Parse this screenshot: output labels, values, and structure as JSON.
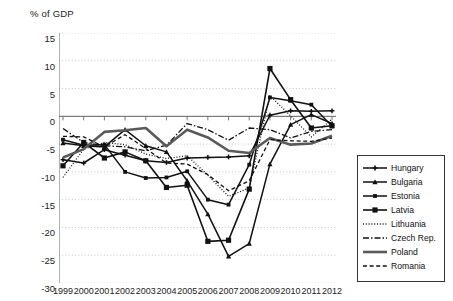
{
  "chart": {
    "axis_title": "% of GDP",
    "y_ticks": [
      "15",
      "10",
      "5",
      "0",
      "-5",
      "-10",
      "-15",
      "-20",
      "-25",
      "-30"
    ],
    "x_ticks": [
      "1999",
      "2000",
      "2001",
      "2002",
      "2003",
      "2004",
      "2005",
      "2006",
      "2007",
      "2008",
      "2009",
      "2010",
      "2011",
      "2012"
    ]
  },
  "legend": {
    "items": [
      {
        "label": "Hungary",
        "key": "line-marker-cross"
      },
      {
        "label": "Bulgaria",
        "key": "line-marker-triangle"
      },
      {
        "label": "Estonia",
        "key": "line-marker-diamond"
      },
      {
        "label": "Latvia",
        "key": "line-marker-square"
      },
      {
        "label": "Lithuania",
        "key": "line-dotted"
      },
      {
        "label": "Czech Rep.",
        "key": "line-dash-dot"
      },
      {
        "label": "Poland",
        "key": "line-thick-double"
      },
      {
        "label": "Romania",
        "key": "line-dashed"
      }
    ]
  },
  "chart_data": {
    "type": "line",
    "title": "",
    "xlabel": "",
    "ylabel": "% of GDP",
    "ylim": [
      -30,
      15
    ],
    "ytick_step": 5,
    "grid": true,
    "legend_position": "right-inside",
    "x": [
      1999,
      2000,
      2001,
      2002,
      2003,
      2004,
      2005,
      2006,
      2007,
      2008,
      2009,
      2010,
      2011,
      2012
    ],
    "series": [
      {
        "name": "Hungary",
        "values": [
          -7.8,
          -8.4,
          -6.0,
          -7.0,
          -8.0,
          -8.3,
          -7.5,
          -7.4,
          -7.3,
          -7.1,
          0.2,
          1.0,
          0.9,
          1.0
        ]
      },
      {
        "name": "Bulgaria",
        "values": [
          -4.8,
          -5.3,
          -5.5,
          -2.4,
          -5.3,
          -6.4,
          -11.6,
          -17.6,
          -25.2,
          -22.9,
          -8.6,
          -1.5,
          0.3,
          -1.3
        ]
      },
      {
        "name": "Estonia",
        "values": [
          -4.2,
          -5.2,
          -5.1,
          -10.0,
          -11.1,
          -11.0,
          -9.9,
          -15.0,
          -15.9,
          -8.7,
          3.4,
          2.8,
          2.1,
          -1.8
        ]
      },
      {
        "name": "Latvia",
        "values": [
          -8.9,
          -4.7,
          -7.5,
          -6.4,
          -8.0,
          -12.8,
          -12.4,
          -22.5,
          -22.3,
          -13.1,
          8.6,
          3.0,
          -2.1,
          -1.7
        ]
      },
      {
        "name": "Lithuania",
        "values": [
          -11.0,
          -5.9,
          -4.7,
          -5.1,
          -6.8,
          -7.6,
          -7.1,
          -10.6,
          -14.4,
          -12.9,
          3.7,
          0.1,
          -3.7,
          -0.5
        ]
      },
      {
        "name": "Czech Rep.",
        "values": [
          -2.2,
          -4.7,
          -5.3,
          -5.5,
          -6.2,
          -5.2,
          -1.3,
          -2.4,
          -4.3,
          -2.1,
          -2.4,
          -3.9,
          -2.7,
          -2.4
        ]
      },
      {
        "name": "Poland",
        "values": [
          -7.4,
          -5.9,
          -2.8,
          -2.5,
          -2.1,
          -5.4,
          -2.4,
          -3.8,
          -6.2,
          -6.6,
          -3.9,
          -5.1,
          -4.9,
          -3.5
        ]
      },
      {
        "name": "Romania",
        "values": [
          -3.6,
          -3.7,
          -5.5,
          -3.3,
          -5.8,
          -8.4,
          -8.6,
          -10.5,
          -13.4,
          -11.6,
          -4.2,
          -4.4,
          -4.5,
          -3.9
        ]
      }
    ]
  }
}
